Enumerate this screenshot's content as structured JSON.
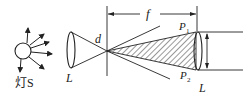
{
  "diagram": {
    "title": "",
    "labels": {
      "lamp": "灯S",
      "lens_left": "L",
      "lens_right": "L",
      "d": "d",
      "f": "f",
      "p1": "P",
      "p1_sub": "1",
      "p2": "P",
      "p2_sub": "2"
    },
    "colors": {
      "stroke": "#222222",
      "background": "#ffffff"
    }
  }
}
